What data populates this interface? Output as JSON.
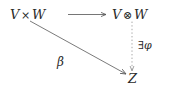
{
  "figure": {
    "kind": "commutative-diagram",
    "background_color": "#ffffff",
    "ink_color": "#2a2a2a"
  },
  "nodes": {
    "top_left": {
      "id": "V x W",
      "left_operand": "V",
      "operator": "×",
      "right_operand": "W"
    },
    "top_right": {
      "id": "V ⊗ W",
      "left_operand": "V",
      "operator": "⊗",
      "right_operand": "W"
    },
    "bottom_right": {
      "id": "Z",
      "label": "Z"
    }
  },
  "edges": {
    "horizontal": {
      "name": "canonical-map",
      "from": "V × W",
      "to": "V ⊗ W",
      "style": "solid",
      "arrowhead": "right",
      "label": ""
    },
    "diagonal": {
      "name": "bilinear-map",
      "from": "V × W",
      "to": "Z",
      "style": "solid",
      "arrowhead": "right",
      "label": "β"
    },
    "vertical": {
      "name": "unique-induced-map",
      "from": "V ⊗ W",
      "to": "Z",
      "style": "dotted",
      "arrowhead": "down",
      "label_quantifier": "∃",
      "label_symbol": "φ",
      "label": "∃φ"
    }
  }
}
